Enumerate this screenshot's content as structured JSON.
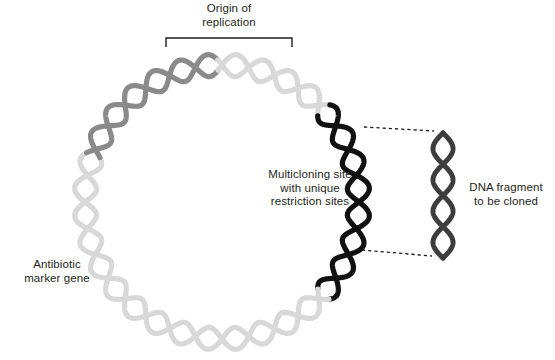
{
  "figure": {
    "background_color": "#ffffff"
  },
  "labels": {
    "origin_of_replication": "Origin of\nreplication",
    "multicloning_site": "Multicloning site\nwith unique\nrestriction sites",
    "dna_fragment": "DNA fragment\nto be cloned",
    "antibiotic_marker": "Antibiotic\nmarker gene"
  },
  "colors": {
    "text": "#231f20",
    "plasmid_backbone": "#d8d8d8",
    "antibiotic_gene": "#8a8a8a",
    "multicloning_site": "#111111",
    "dna_fragment": "#3d3d3d",
    "bracket": "#231f20",
    "dotted_connector": "#1a1a1a"
  },
  "geometry": {
    "ring_center_x": 222,
    "ring_center_y": 202,
    "ring_radius": 137,
    "helix_amplitude": 11,
    "helix_periods": 16,
    "strand_width": 5.2,
    "bracket_left_x": 166,
    "bracket_right_x": 292,
    "bracket_top_y": 38,
    "bracket_tick_length": 9,
    "fragment_center_x": 443,
    "fragment_top_y": 133,
    "fragment_bottom_y": 258,
    "fragment_amplitude": 10,
    "fragment_strand_width": 5.0
  },
  "segments": [
    {
      "name": "plasmid-backbone",
      "color": "#d8d8d8",
      "start_deg": -58,
      "end_deg": 200
    },
    {
      "name": "antibiotic-marker-gene",
      "color": "#8a8a8a",
      "start_deg": 200,
      "end_deg": 268
    },
    {
      "name": "multicloning-site",
      "color": "#111111",
      "start_deg": -42,
      "end_deg": 42
    }
  ]
}
